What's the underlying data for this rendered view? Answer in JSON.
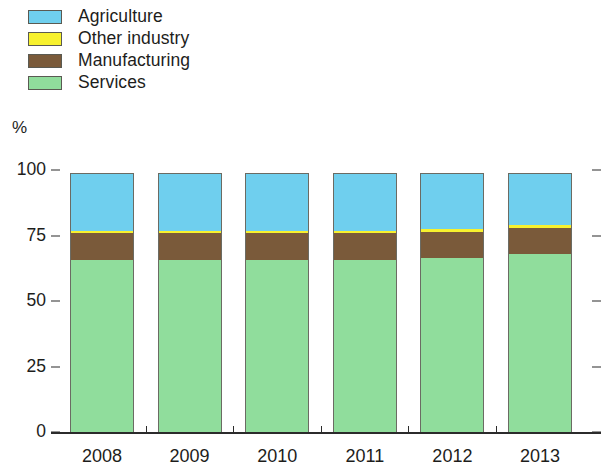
{
  "legend": {
    "position": "top-left",
    "items": [
      {
        "label": "Agriculture",
        "color": "#6fcfee",
        "key": "agriculture"
      },
      {
        "label": "Other industry",
        "color": "#f7f12e",
        "key": "other_industry"
      },
      {
        "label": "Manufacturing",
        "color": "#7a5a3a",
        "key": "manufacturing"
      },
      {
        "label": "Services",
        "color": "#90dd9c",
        "key": "services"
      }
    ]
  },
  "axes": {
    "y_unit_label": "%",
    "y_ticks": [
      "0",
      "25",
      "50",
      "75",
      "100"
    ],
    "y_tick_values": [
      0,
      25,
      50,
      75,
      100
    ],
    "x_ticks": [
      "2008",
      "2009",
      "2010",
      "2011",
      "2012",
      "2013"
    ]
  },
  "chart_data": {
    "type": "bar",
    "stacked": true,
    "title": "",
    "subtitle": "",
    "xlabel": "",
    "ylabel": "%",
    "ylim": [
      0,
      100
    ],
    "grid": false,
    "legend_position": "top-left",
    "categories": [
      "2008",
      "2009",
      "2010",
      "2011",
      "2012",
      "2013"
    ],
    "series": [
      {
        "name": "Services",
        "color": "#90dd9c",
        "values": [
          65.5,
          65.5,
          65.5,
          65.5,
          66.5,
          68.0
        ]
      },
      {
        "name": "Manufacturing",
        "color": "#7a5a3a",
        "values": [
          10.5,
          10.5,
          10.5,
          10.5,
          10.0,
          10.0
        ]
      },
      {
        "name": "Other industry",
        "color": "#f7f12e",
        "values": [
          0.8,
          0.8,
          0.8,
          0.9,
          1.0,
          1.0
        ]
      },
      {
        "name": "Agriculture",
        "color": "#6fcfee",
        "values": [
          22.2,
          22.2,
          22.2,
          22.1,
          21.5,
          20.0
        ]
      }
    ],
    "stack_order_bottom_to_top": [
      "Services",
      "Manufacturing",
      "Other industry",
      "Agriculture"
    ],
    "annotations": []
  },
  "colors": {
    "axis": "#2b2b2b",
    "text": "#1d1d1b",
    "background": "#ffffff",
    "bar_outline": "#6b6b63"
  },
  "geometry": {
    "plot_left": 70,
    "plot_right": 580,
    "baseline_y": 432,
    "top_y": 170,
    "bar_width": 64,
    "bar_pitch": 87.6
  }
}
